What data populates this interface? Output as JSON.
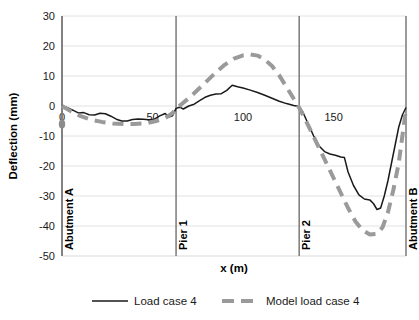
{
  "chart_data": {
    "type": "line",
    "title": "",
    "xlabel": "x (m)",
    "ylabel": "Deflection (mm)",
    "xlim": [
      0,
      190
    ],
    "ylim": [
      -50,
      30
    ],
    "xticks": [
      0,
      50,
      100,
      150
    ],
    "yticks": [
      30,
      20,
      10,
      0,
      -10,
      -20,
      -30,
      -40,
      -50
    ],
    "grid": "horizontal",
    "legend_position": "bottom",
    "annotations": [
      {
        "label": "Abutment A",
        "x": 0
      },
      {
        "label": "Pier 1",
        "x": 63
      },
      {
        "label": "Pier 2",
        "x": 131
      },
      {
        "label": "Abutment B",
        "x": 190
      }
    ],
    "series": [
      {
        "name": "Load case 4",
        "style": "solid",
        "color": "#1a1a1a",
        "points": [
          [
            0,
            0.0
          ],
          [
            3,
            -0.6
          ],
          [
            6,
            -1.4
          ],
          [
            9,
            -2.3
          ],
          [
            12,
            -2.2
          ],
          [
            15,
            -2.9
          ],
          [
            18,
            -3.0
          ],
          [
            21,
            -2.4
          ],
          [
            24,
            -2.6
          ],
          [
            27,
            -3.4
          ],
          [
            30,
            -4.4
          ],
          [
            33,
            -5.0
          ],
          [
            36,
            -5.0
          ],
          [
            39,
            -4.5
          ],
          [
            42,
            -4.3
          ],
          [
            45,
            -4.4
          ],
          [
            48,
            -4.6
          ],
          [
            51,
            -4.4
          ],
          [
            54,
            -3.3
          ],
          [
            57,
            -2.5
          ],
          [
            59,
            -3.7
          ],
          [
            61,
            -3.3
          ],
          [
            63,
            -0.8
          ],
          [
            65,
            -0.4
          ],
          [
            67,
            -1.0
          ],
          [
            70,
            0.0
          ],
          [
            73,
            0.6
          ],
          [
            76,
            1.8
          ],
          [
            79,
            2.9
          ],
          [
            82,
            3.6
          ],
          [
            85,
            4.0
          ],
          [
            88,
            4.1
          ],
          [
            91,
            5.2
          ],
          [
            94,
            6.9
          ],
          [
            97,
            6.4
          ],
          [
            100,
            6.0
          ],
          [
            104,
            5.3
          ],
          [
            108,
            4.5
          ],
          [
            112,
            3.6
          ],
          [
            116,
            2.6
          ],
          [
            120,
            1.6
          ],
          [
            124,
            0.8
          ],
          [
            128,
            0.2
          ],
          [
            131,
            -0.2
          ],
          [
            133,
            -2.0
          ],
          [
            136,
            -6.0
          ],
          [
            139,
            -10.0
          ],
          [
            142,
            -13.3
          ],
          [
            145,
            -15.2
          ],
          [
            148,
            -16.0
          ],
          [
            151,
            -16.4
          ],
          [
            154,
            -17.0
          ],
          [
            156,
            -17.2
          ],
          [
            158,
            -22.0
          ],
          [
            161,
            -26.5
          ],
          [
            164,
            -29.6
          ],
          [
            167,
            -31.0
          ],
          [
            170,
            -31.3
          ],
          [
            172,
            -32.5
          ],
          [
            174,
            -34.5
          ],
          [
            176,
            -34.0
          ],
          [
            178,
            -30.0
          ],
          [
            180,
            -25.0
          ],
          [
            182,
            -19.0
          ],
          [
            184,
            -13.0
          ],
          [
            186,
            -7.0
          ],
          [
            188,
            -3.0
          ],
          [
            190,
            -0.5
          ]
        ]
      },
      {
        "name": "Model load case 4",
        "style": "dashed",
        "color": "#9a9a9a",
        "points": [
          [
            0,
            0.0
          ],
          [
            5,
            -1.8
          ],
          [
            10,
            -3.3
          ],
          [
            16,
            -4.6
          ],
          [
            22,
            -5.3
          ],
          [
            28,
            -5.8
          ],
          [
            34,
            -6.0
          ],
          [
            40,
            -6.0
          ],
          [
            46,
            -5.8
          ],
          [
            52,
            -5.0
          ],
          [
            57,
            -4.0
          ],
          [
            61,
            -2.4
          ],
          [
            63,
            -0.9
          ],
          [
            66,
            0.6
          ],
          [
            70,
            2.6
          ],
          [
            75,
            5.4
          ],
          [
            80,
            8.3
          ],
          [
            85,
            11.2
          ],
          [
            90,
            13.8
          ],
          [
            95,
            15.8
          ],
          [
            100,
            16.9
          ],
          [
            104,
            17.2
          ],
          [
            108,
            16.8
          ],
          [
            112,
            15.5
          ],
          [
            116,
            13.3
          ],
          [
            120,
            10.2
          ],
          [
            124,
            6.3
          ],
          [
            128,
            2.4
          ],
          [
            131,
            -0.6
          ],
          [
            134,
            -4.0
          ],
          [
            138,
            -9.0
          ],
          [
            142,
            -14.0
          ],
          [
            146,
            -19.0
          ],
          [
            150,
            -24.0
          ],
          [
            154,
            -29.0
          ],
          [
            158,
            -34.0
          ],
          [
            162,
            -38.4
          ],
          [
            166,
            -41.4
          ],
          [
            170,
            -42.8
          ],
          [
            174,
            -42.6
          ],
          [
            177,
            -40.5
          ],
          [
            180,
            -35.5
          ],
          [
            183,
            -28.0
          ],
          [
            186,
            -19.0
          ],
          [
            188,
            -10.0
          ],
          [
            190,
            -1.0
          ]
        ]
      }
    ]
  },
  "legend": {
    "items": [
      {
        "label": "Load case 4"
      },
      {
        "label": "Model load case 4"
      }
    ]
  }
}
